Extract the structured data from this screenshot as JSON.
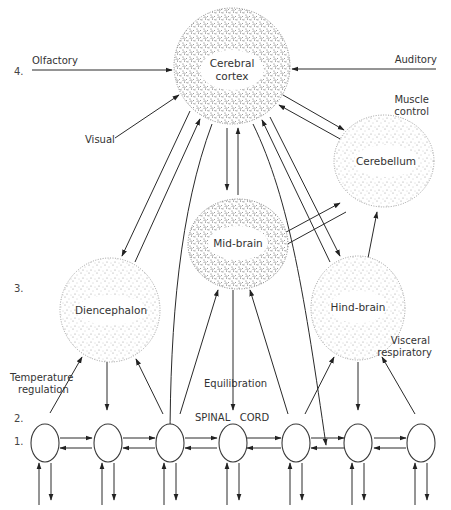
{
  "diagram": {
    "type": "hierarchical neural organization diagram",
    "levels": [
      {
        "label": "4.",
        "name": "level-4"
      },
      {
        "label": "3.",
        "name": "level-3"
      },
      {
        "label": "2.",
        "name": "level-2"
      },
      {
        "label": "1.",
        "name": "level-1"
      }
    ],
    "structures": {
      "cerebral_cortex": {
        "line1": "Cerebral",
        "line2": "cortex"
      },
      "cerebellum": {
        "label": "Cerebellum"
      },
      "mid_brain": {
        "label": "Mid-brain"
      },
      "diencephalon": {
        "label": "Diencephalon"
      },
      "hind_brain": {
        "label": "Hind-brain"
      },
      "spinal_cord": {
        "label": "SPINAL   CORD",
        "segments": 7
      }
    },
    "inputs": {
      "olfactory": "Olfactory",
      "auditory": "Auditory",
      "visual": "Visual",
      "muscle_control_1": "Muscle",
      "muscle_control_2": "control",
      "temperature_1": "Temperature",
      "temperature_2": "regulation",
      "equilibration": "Equilibration",
      "visceral_1": "Visceral",
      "visceral_2": "respiratory"
    },
    "connections": [
      {
        "from": "Olfactory",
        "to": "Cerebral cortex"
      },
      {
        "from": "Auditory",
        "to": "Cerebral cortex"
      },
      {
        "from": "Visual",
        "to": "Cerebral cortex"
      },
      {
        "from": "Cerebral cortex",
        "to": "Cerebellum",
        "bidirectional": true
      },
      {
        "from": "Cerebral cortex",
        "to": "Mid-brain",
        "bidirectional": true
      },
      {
        "from": "Cerebral cortex",
        "to": "Diencephalon",
        "bidirectional": true
      },
      {
        "from": "Cerebral cortex",
        "to": "Hind-brain",
        "bidirectional": true
      },
      {
        "from": "Cerebral cortex",
        "to": "Spinal cord",
        "bidirectional": true
      },
      {
        "from": "Mid-brain",
        "to": "Cerebellum",
        "bidirectional": true
      },
      {
        "from": "Hind-brain",
        "to": "Cerebellum"
      },
      {
        "from": "Spinal cord",
        "to": "Diencephalon",
        "bidirectional": true
      },
      {
        "from": "Spinal cord",
        "to": "Mid-brain",
        "bidirectional": true
      },
      {
        "from": "Spinal cord",
        "to": "Hind-brain",
        "bidirectional": true
      }
    ]
  }
}
